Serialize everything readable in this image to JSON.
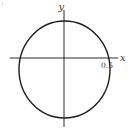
{
  "diagram": {
    "type": "circle-on-axes",
    "axes": {
      "x_label": "x",
      "y_label": "y"
    },
    "annotations": {
      "x_intercept_label": "0.5"
    },
    "colors": {
      "stroke": "#1e1e1e",
      "text": "#333333",
      "background": "#ffffff"
    }
  }
}
